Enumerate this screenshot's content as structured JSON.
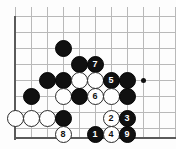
{
  "figure": {
    "board": {
      "grid_origin_x": 15,
      "grid_origin_y": 16,
      "grid_spacing": 16,
      "cols": 10,
      "rows": 8,
      "line_color": "#b9b9b9",
      "edge_color": "#5a5a5a",
      "background": "#fdfdfd",
      "black_color": "#101010",
      "white_color": "#fefefe"
    },
    "star_points": [
      {
        "name": "hoshi-right",
        "x": 143,
        "y": 80
      }
    ],
    "edges": [
      {
        "name": "left-board-edge",
        "orientation": "v",
        "x": 14,
        "y": 16,
        "length": 124
      },
      {
        "name": "bottom-board-edge",
        "orientation": "h",
        "x": 14,
        "y": 137,
        "length": 162
      }
    ],
    "grid_lines": {
      "horizontal_y": [
        16,
        32,
        48,
        64,
        80,
        96,
        112,
        128
      ],
      "vertical_x": [
        15,
        31,
        47,
        63,
        79,
        95,
        111,
        127,
        143,
        159,
        175
      ]
    },
    "stones": [
      {
        "name": "stone-black-plain-1",
        "color": "black",
        "label": "",
        "x": 63,
        "y": 48
      },
      {
        "name": "stone-black-plain-2",
        "color": "black",
        "label": "",
        "x": 79,
        "y": 64
      },
      {
        "name": "stone-black-move-7",
        "color": "black",
        "label": "7",
        "x": 95,
        "y": 64
      },
      {
        "name": "stone-black-plain-3",
        "color": "black",
        "label": "",
        "x": 47,
        "y": 80
      },
      {
        "name": "stone-black-plain-4",
        "color": "black",
        "label": "",
        "x": 63,
        "y": 80
      },
      {
        "name": "stone-white-plain-1",
        "color": "white",
        "label": "",
        "x": 79,
        "y": 80
      },
      {
        "name": "stone-white-plain-2",
        "color": "white",
        "label": "",
        "x": 95,
        "y": 80
      },
      {
        "name": "stone-black-move-5",
        "color": "black",
        "label": "5",
        "x": 111,
        "y": 80
      },
      {
        "name": "stone-black-plain-5",
        "color": "black",
        "label": "",
        "x": 127,
        "y": 80
      },
      {
        "name": "stone-black-plain-6",
        "color": "black",
        "label": "",
        "x": 31,
        "y": 96
      },
      {
        "name": "stone-white-plain-3",
        "color": "white",
        "label": "",
        "x": 63,
        "y": 96
      },
      {
        "name": "stone-black-plain-7",
        "color": "black",
        "label": "",
        "x": 79,
        "y": 96
      },
      {
        "name": "stone-white-move-6",
        "color": "white",
        "label": "6",
        "x": 95,
        "y": 96
      },
      {
        "name": "stone-white-plain-4",
        "color": "white",
        "label": "",
        "x": 111,
        "y": 96
      },
      {
        "name": "stone-black-plain-8",
        "color": "black",
        "label": "",
        "x": 127,
        "y": 96
      },
      {
        "name": "stone-white-plain-5",
        "color": "white",
        "label": "",
        "x": 15,
        "y": 118
      },
      {
        "name": "stone-white-plain-6",
        "color": "white",
        "label": "",
        "x": 31,
        "y": 118
      },
      {
        "name": "stone-white-plain-7",
        "color": "white",
        "label": "",
        "x": 47,
        "y": 118
      },
      {
        "name": "stone-black-plain-9",
        "color": "black",
        "label": "",
        "x": 63,
        "y": 118
      },
      {
        "name": "stone-white-move-2",
        "color": "white",
        "label": "2",
        "x": 111,
        "y": 118
      },
      {
        "name": "stone-black-move-3",
        "color": "black",
        "label": "3",
        "x": 127,
        "y": 118
      },
      {
        "name": "stone-white-move-8",
        "color": "white",
        "label": "8",
        "x": 63,
        "y": 134
      },
      {
        "name": "stone-black-move-1",
        "color": "black",
        "label": "1",
        "x": 95,
        "y": 134
      },
      {
        "name": "stone-white-move-4",
        "color": "white",
        "label": "4",
        "x": 111,
        "y": 134
      },
      {
        "name": "stone-black-move-9",
        "color": "black",
        "label": "9",
        "x": 127,
        "y": 134
      }
    ]
  }
}
